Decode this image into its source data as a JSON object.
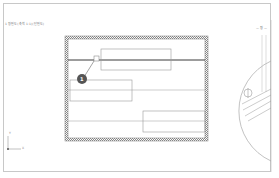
{
  "caption": "1 평면도(축척 1:1)(단면도)",
  "view_label": "— 평 —",
  "callout": {
    "number": "1"
  },
  "axes": {
    "y_label": "Y",
    "x_label": "X"
  },
  "colors": {
    "frame": "#c8c8c8",
    "hatch": "#9a9a9a",
    "line": "#888888",
    "dark_line": "#3a3a3a",
    "callout_fill": "#555555"
  }
}
